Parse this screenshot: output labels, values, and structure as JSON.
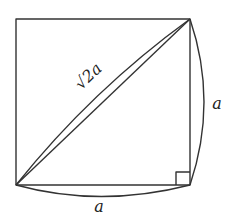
{
  "diagram": {
    "title": "",
    "labels": {
      "diagonal": "√2a",
      "right_side": "a",
      "bottom_side": "a"
    },
    "square": {
      "x": 16,
      "y": 19,
      "size": 174
    },
    "stroke_color": "#333333",
    "background": "#ffffff",
    "elements": [
      "square-outline",
      "straight-diagonal",
      "curved-arc-diagonal",
      "curved-arc-right",
      "curved-arc-bottom",
      "right-angle-marker"
    ]
  }
}
